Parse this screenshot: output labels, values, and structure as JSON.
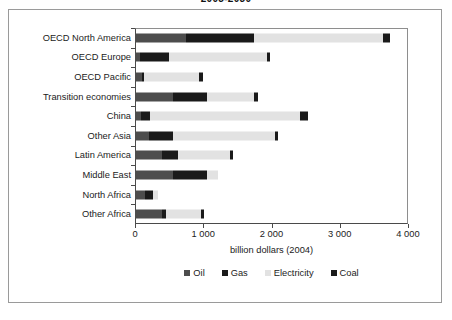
{
  "chart_data": {
    "type": "bar",
    "orientation": "horizontal",
    "stacked": true,
    "title": "2005-2030",
    "xlabel": "billion dollars (2004)",
    "ylabel": "",
    "xlim": [
      0,
      4000
    ],
    "xticks": [
      0,
      1000,
      2000,
      3000,
      4000
    ],
    "xtick_labels": [
      "0",
      "1 000",
      "2 000",
      "3 000",
      "4 000"
    ],
    "grid": false,
    "legend_position": "bottom",
    "categories": [
      "OECD North America",
      "OECD Europe",
      "OECD Pacific",
      "Transition economies",
      "China",
      "Other Asia",
      "Latin America",
      "Middle East",
      "North Africa",
      "Other Africa"
    ],
    "series": [
      {
        "name": "Oil",
        "color": "#4d4d4d",
        "values": [
          740,
          70,
          100,
          550,
          90,
          200,
          400,
          560,
          150,
          390
        ]
      },
      {
        "name": "Gas",
        "color": "#1a1a1a",
        "values": [
          1000,
          430,
          30,
          510,
          130,
          350,
          230,
          500,
          110,
          70
        ]
      },
      {
        "name": "Electricity",
        "color": "#e2e2e2",
        "values": [
          1890,
          1430,
          810,
          690,
          2200,
          1500,
          760,
          160,
          70,
          510
        ]
      },
      {
        "name": "Coal",
        "color": "#1a1a1a",
        "values": [
          110,
          50,
          50,
          50,
          120,
          50,
          40,
          0,
          0,
          35
        ]
      }
    ],
    "totals": [
      3740,
      1980,
      990,
      1800,
      2540,
      2100,
      1430,
      1220,
      330,
      1005
    ]
  }
}
